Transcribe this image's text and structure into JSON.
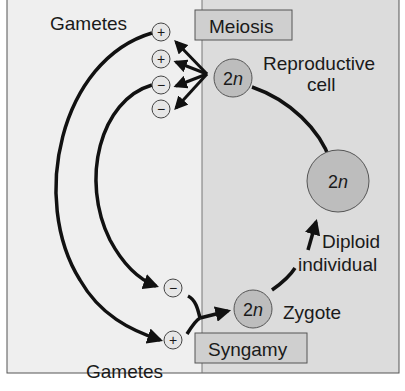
{
  "diagram": {
    "labels": {
      "gametes_top": "Gametes",
      "gametes_bottom": "Gametes",
      "meiosis": "Meiosis",
      "syngamy": "Syngamy",
      "reproductive_cell_line1": "Reproductive",
      "reproductive_cell_line2": "cell",
      "diploid_line1": "Diploid",
      "diploid_line2": "individual",
      "zygote": "Zygote"
    },
    "cells": {
      "reproductive": {
        "ploidy_num": "2",
        "ploidy_var": "n"
      },
      "diploid_individual": {
        "ploidy_num": "2",
        "ploidy_var": "n"
      },
      "zygote": {
        "ploidy_num": "2",
        "ploidy_var": "n"
      }
    },
    "gametes_top": [
      "+",
      "+",
      "−",
      "−"
    ],
    "gametes_bottom": [
      "−",
      "+"
    ],
    "colors": {
      "left_panel": "#efefef",
      "right_panel": "#dcdcdc",
      "cell_fill": "#bdbdbd",
      "label_box_fill": "#cfcfcf",
      "gamete_fill": "#e6e6e6",
      "stroke": "#111111"
    }
  }
}
